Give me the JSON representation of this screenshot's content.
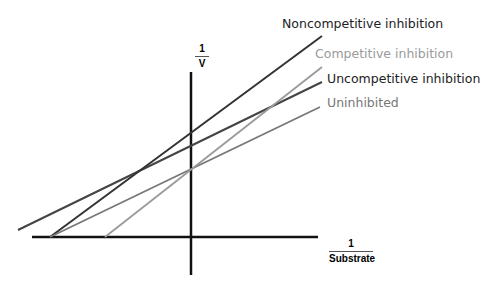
{
  "diagram": {
    "y_axis": {
      "numerator": "1",
      "denominator": "V"
    },
    "x_axis": {
      "numerator": "1",
      "denominator": "Substrate"
    },
    "lines": [
      {
        "name": "Noncompetitive inhibition",
        "color": "#333333",
        "text_color": "#222222"
      },
      {
        "name": "Competitive inhibition",
        "color": "#9a9a9a",
        "text_color": "#9a9a9a"
      },
      {
        "name": "Uncompetitive inhibition",
        "color": "#444444",
        "text_color": "#222222"
      },
      {
        "name": "Uninhibited",
        "color": "#777777",
        "text_color": "#777777"
      }
    ]
  }
}
